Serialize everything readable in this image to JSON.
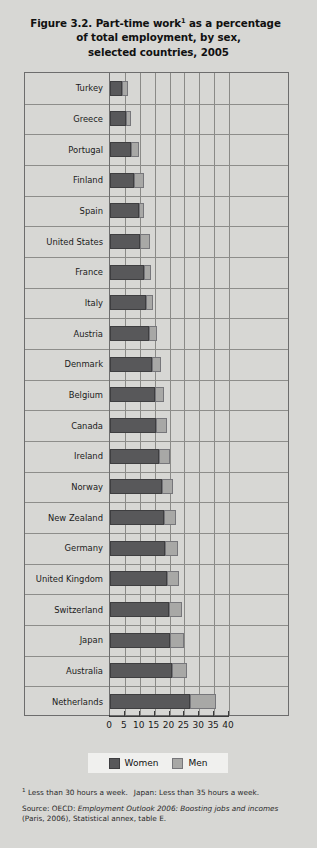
{
  "figure": {
    "title_lines": [
      "Figure 3.2.  Part-time work",
      "of total employment, by sex,",
      "selected countries, 2005"
    ],
    "title_superscript": "1",
    "title_line1_rest": " as a percentage"
  },
  "legend": {
    "women_label": "Women",
    "men_label": "Men"
  },
  "footnotes": {
    "marker": "1",
    "note1_part1": " Less than 30 hours a week.",
    "note1_part2": "Japan: Less than 35 hours a week.",
    "source_prefix": "Source: OECD: ",
    "source_italic1": "Employment Outlook 2006: Boosting jobs and incomes",
    "source_rest": " (Paris, 2006), Statistical annex, table E."
  },
  "chart_data": {
    "type": "bar",
    "orientation": "horizontal",
    "stacked": true,
    "xlabel": "",
    "ylabel": "",
    "xlim": [
      0,
      40
    ],
    "xticks": [
      0,
      5,
      10,
      15,
      20,
      25,
      30,
      35,
      40
    ],
    "grid": true,
    "legend_position": "bottom",
    "categories": [
      "Turkey",
      "Greece",
      "Portugal",
      "Finland",
      "Spain",
      "United States",
      "France",
      "Italy",
      "Austria",
      "Denmark",
      "Belgium",
      "Canada",
      "Ireland",
      "Norway",
      "New Zealand",
      "Germany",
      "United Kingdom",
      "Switzerland",
      "Japan",
      "Australia",
      "Netherlands"
    ],
    "series": [
      {
        "name": "Women",
        "color": "#58585a",
        "values": [
          4.0,
          5.3,
          7.1,
          8.2,
          9.8,
          10.2,
          11.5,
          12.2,
          13.2,
          14.2,
          15.0,
          15.6,
          16.4,
          17.6,
          18.1,
          18.6,
          19.0,
          19.8,
          20.0,
          20.8,
          27.0
        ]
      },
      {
        "name": "Men",
        "color": "#a8a8a6",
        "values": [
          2.2,
          1.7,
          2.6,
          3.3,
          1.8,
          3.2,
          2.2,
          2.4,
          2.5,
          3.1,
          3.0,
          3.5,
          3.8,
          3.6,
          4.0,
          4.4,
          4.2,
          4.4,
          5.0,
          5.2,
          8.5
        ]
      }
    ],
    "totals": [
      6.2,
      7.0,
      9.7,
      11.5,
      11.6,
      13.4,
      13.7,
      14.6,
      15.7,
      17.3,
      18.0,
      19.1,
      20.2,
      21.2,
      22.1,
      23.0,
      23.2,
      24.2,
      25.0,
      26.0,
      35.5
    ]
  },
  "colors": {
    "background": "#d7d7d4",
    "women": "#58585a",
    "men": "#a8a8a6",
    "frame": "#6d6d6d",
    "grid": "#8a8a87",
    "text": "#1a1a1a"
  }
}
